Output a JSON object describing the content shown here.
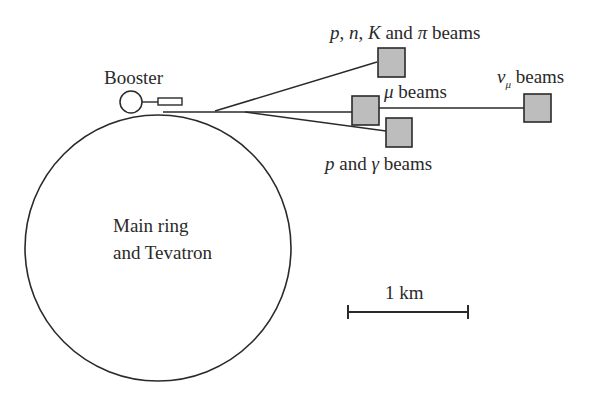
{
  "diagram": {
    "labels": {
      "booster": "Booster",
      "main_ring_line1": "Main ring",
      "main_ring_line2": "and Tevatron",
      "pnk_beams_p": "p",
      "pnk_beams_n": "n",
      "pnk_beams_k": "K",
      "pnk_beams_and": "and",
      "pnk_beams_pi": "π",
      "pnk_beams_suffix": "beams",
      "mu_symbol": "μ",
      "mu_suffix": "beams",
      "nu_symbol": "ν",
      "nu_sub": "μ",
      "nu_suffix": "beams",
      "pg_p": "p",
      "pg_and": "and",
      "pg_gamma": "γ",
      "pg_suffix": "beams",
      "scale": "1 km"
    },
    "colors": {
      "line": "#2a2a2a",
      "box_fill": "#bdbdbd",
      "background": "#ffffff"
    }
  }
}
